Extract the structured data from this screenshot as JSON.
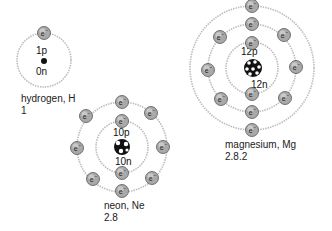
{
  "diagram": {
    "type": "bohr-atom-models",
    "colors": {
      "orbit": "#b8b8b8",
      "electron_fill": "#a8a8a8",
      "electron_stroke": "#555555",
      "nucleus": "#111111",
      "text": "#222222"
    },
    "electron_symbol": "e⁻",
    "atoms": [
      {
        "name": "hydrogen",
        "label": "hydrogen, H",
        "config": "1",
        "protons": "1p",
        "neutrons": "0n",
        "shells": [
          1
        ]
      },
      {
        "name": "neon",
        "label": "neon, Ne",
        "config": "2.8",
        "protons": "10p",
        "neutrons": "10n",
        "shells": [
          2,
          8
        ]
      },
      {
        "name": "magnesium",
        "label": "magnesium, Mg",
        "config": "2.8.2",
        "protons": "12p",
        "neutrons": "12n",
        "shells": [
          2,
          8,
          2
        ]
      }
    ]
  }
}
